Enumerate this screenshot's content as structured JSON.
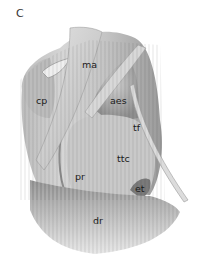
{
  "figure": {
    "panel_letter": "C",
    "type": "anatomical illustration (grayscale)",
    "labels": [
      {
        "id": "ma",
        "text": "ma",
        "x": 82,
        "y": 60
      },
      {
        "id": "cp",
        "text": "cp",
        "x": 36,
        "y": 96
      },
      {
        "id": "aes",
        "text": "aes",
        "x": 110,
        "y": 96
      },
      {
        "id": "tf",
        "text": "tf",
        "x": 133,
        "y": 123
      },
      {
        "id": "ttc",
        "text": "ttc",
        "x": 117,
        "y": 154
      },
      {
        "id": "pr",
        "text": "pr",
        "x": 75,
        "y": 172
      },
      {
        "id": "et",
        "text": "et",
        "x": 135,
        "y": 184
      },
      {
        "id": "dr",
        "text": "dr",
        "x": 93,
        "y": 216
      }
    ]
  }
}
